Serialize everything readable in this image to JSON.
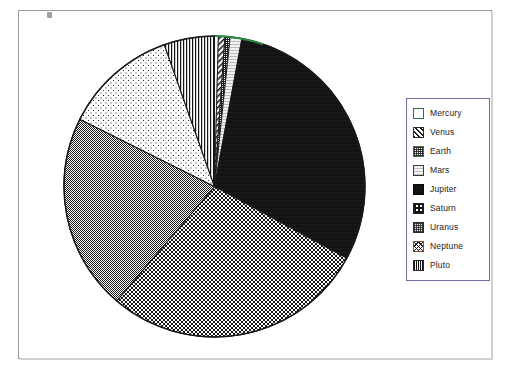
{
  "chart_data": {
    "type": "pie",
    "title": "",
    "legend_position": "right",
    "categories": [
      "Mercury",
      "Venus",
      "Earth",
      "Mars",
      "Jupiter",
      "Saturn",
      "Uranus",
      "Neptune",
      "Pluto"
    ],
    "values": [
      1.5,
      2.5,
      2.0,
      4.5,
      108.0,
      102.0,
      76.0,
      44.0,
      19.5
    ],
    "unit": "degrees of arc",
    "slices": [
      {
        "label": "Mercury",
        "start_deg": 0.0,
        "sweep_deg": 1.5,
        "pattern": "solid-white",
        "fill": "#ffffff"
      },
      {
        "label": "Venus",
        "start_deg": 1.5,
        "sweep_deg": 2.5,
        "pattern": "diagonal-hatch",
        "fill": "#1d1d1d"
      },
      {
        "label": "Earth",
        "start_deg": 4.0,
        "sweep_deg": 2.0,
        "pattern": "fine-crosshatch",
        "fill": "#3a3a3a"
      },
      {
        "label": "Mars",
        "start_deg": 6.0,
        "sweep_deg": 4.5,
        "pattern": "light-horizontal",
        "fill": "#e8e8e8"
      },
      {
        "label": "Jupiter",
        "start_deg": 10.5,
        "sweep_deg": 108.0,
        "pattern": "solid-black",
        "fill": "#131313"
      },
      {
        "label": "Saturn",
        "start_deg": 118.5,
        "sweep_deg": 102.0,
        "pattern": "coarse-checker",
        "fill": "#6a6a6a"
      },
      {
        "label": "Uranus",
        "start_deg": 220.5,
        "sweep_deg": 76.0,
        "pattern": "medium-grey-dither",
        "fill": "#9d9d9d"
      },
      {
        "label": "Neptune",
        "start_deg": 296.5,
        "sweep_deg": 44.0,
        "pattern": "sparse-dots",
        "fill": "#f0f0f0"
      },
      {
        "label": "Pluto",
        "start_deg": 340.5,
        "sweep_deg": 19.5,
        "pattern": "vertical-lines",
        "fill": "#7d7d7d"
      }
    ]
  },
  "legend": {
    "border_color": "#6f6fa8",
    "items": [
      {
        "label": "Mercury",
        "swatch": "mercury-swatch"
      },
      {
        "label": "Venus",
        "swatch": "venus-swatch"
      },
      {
        "label": "Earth",
        "swatch": "earth-swatch"
      },
      {
        "label": "Mars",
        "swatch": "mars-swatch"
      },
      {
        "label": "Jupiter",
        "swatch": "jupiter-swatch"
      },
      {
        "label": "Saturn",
        "swatch": "saturn-swatch"
      },
      {
        "label": "Uranus",
        "swatch": "uranus-swatch"
      },
      {
        "label": "Neptune",
        "swatch": "neptune-swatch"
      },
      {
        "label": "Pluto",
        "swatch": "pluto-swatch"
      }
    ]
  },
  "frame": {
    "border_color": "#9a9a9e",
    "shadow_color": "#cfcfd4",
    "background": "#ffffff"
  },
  "geometry": {
    "cx": 151.5,
    "cy": 151.5,
    "r": 150.5
  }
}
